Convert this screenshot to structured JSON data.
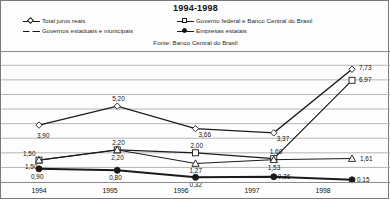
{
  "header": {
    "title": "1994-1998",
    "source": "Fonte: Banco Central do Brasil"
  },
  "legend": {
    "items": [
      {
        "label": "Total juros reais",
        "marker": "diamond-open-marker"
      },
      {
        "label": "Governos estaduais e municipais",
        "marker": "triangle-open-marker"
      },
      {
        "label": "Governo federal e Banco Central do Brasil",
        "marker": "square-open-marker"
      },
      {
        "label": "Empresas estatais",
        "marker": "filled-circle-marker"
      }
    ]
  },
  "axis": {
    "xticks": [
      "1994",
      "1995",
      "1996",
      "1997",
      "1998"
    ]
  },
  "labels": {
    "total": [
      "3,90",
      "5,20",
      "3,66",
      "3,37",
      "7,73"
    ],
    "federal": [
      "1,50",
      "2,20",
      "2,00",
      "1,60",
      "6,97"
    ],
    "estaduais": [
      "1,50",
      "2,20",
      "1,27",
      "1,53",
      "1,61"
    ],
    "estatais": [
      "0,90",
      "0,80",
      "0,32",
      "0,36",
      "0,15"
    ]
  },
  "chart_data": {
    "type": "line",
    "title": "1994-1998",
    "subtitle": "Fonte: Banco Central do Brasil",
    "xlabel": "",
    "ylabel": "",
    "x": [
      "1994",
      "1995",
      "1996",
      "1997",
      "1998"
    ],
    "ylim": [
      0,
      8.5
    ],
    "grid": true,
    "legend_position": "top",
    "series": [
      {
        "name": "Total juros reais",
        "marker": "diamond-open",
        "values": [
          3.9,
          5.2,
          3.66,
          3.37,
          7.73
        ],
        "labels": [
          "3,90",
          "5,20",
          "3,66",
          "3,37",
          "7,73"
        ]
      },
      {
        "name": "Governo federal e Banco Central do Brasil",
        "marker": "square-open",
        "values": [
          1.5,
          2.2,
          2.0,
          1.6,
          6.97
        ],
        "labels": [
          "1,50",
          "2,20",
          "2,00",
          "1,60",
          "6,97"
        ]
      },
      {
        "name": "Governos estaduais e municipais",
        "marker": "triangle-open",
        "values": [
          1.5,
          2.2,
          1.27,
          1.53,
          1.61
        ],
        "labels": [
          "1,50",
          "2,20",
          "1,27",
          "1,53",
          "1,61"
        ]
      },
      {
        "name": "Empresas estatais",
        "marker": "circle-filled",
        "values": [
          0.9,
          0.8,
          0.32,
          0.36,
          0.15
        ],
        "labels": [
          "0,90",
          "0,80",
          "0,32",
          "0,36",
          "0,15"
        ]
      }
    ]
  },
  "colors": {
    "line": "#1a1a1a",
    "grid": "#b5b5b5",
    "border": "#7a7a7a",
    "text": "#111111"
  }
}
